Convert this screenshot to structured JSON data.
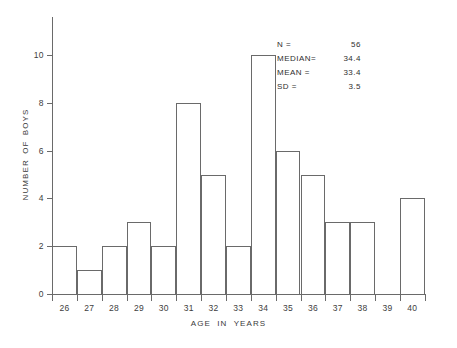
{
  "chart_data": {
    "type": "bar",
    "title": "",
    "xlabel": "AGE IN YEARS",
    "ylabel": "NUMBER OF BOYS",
    "categories": [
      "26",
      "27",
      "28",
      "29",
      "30",
      "31",
      "32",
      "33",
      "34",
      "35",
      "36",
      "37",
      "38",
      "39",
      "40"
    ],
    "values": [
      2,
      1,
      2,
      3,
      2,
      8,
      5,
      2,
      10,
      6,
      5,
      3,
      3,
      0,
      4
    ],
    "xlim": [
      26,
      41
    ],
    "ylim": [
      0,
      11
    ],
    "ytick_labels": [
      "0",
      "2",
      "4",
      "6",
      "8",
      "10"
    ],
    "ytick_values": [
      0,
      2,
      4,
      6,
      8,
      10
    ],
    "grid": false,
    "legend": false,
    "line_color": "#6a6a6a",
    "fill_color": "#ffffff",
    "background": "#ffffff",
    "annotations": [
      {
        "label": "N =",
        "value": "56"
      },
      {
        "label": "MEDIAN=",
        "value": "34.4"
      },
      {
        "label": "MEAN =",
        "value": "33.4"
      },
      {
        "label": "SD =",
        "value": "3.5"
      }
    ]
  }
}
